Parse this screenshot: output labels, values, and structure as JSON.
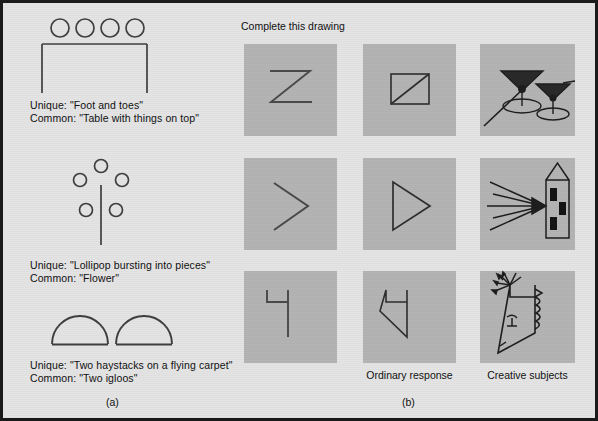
{
  "figure": {
    "background_color": "#e4e4e4",
    "border_color": "#1a1a1a",
    "cell_color": "#b4b4b4",
    "ink_color": "#3a3a3a"
  },
  "panel_a": {
    "letter": "(a)",
    "items": [
      {
        "name": "table-with-things-on-top",
        "unique": "Unique: \"Foot and toes\"",
        "common": "Common: \"Table with things on top\""
      },
      {
        "name": "flower",
        "unique": "Unique: \"Lollipop bursting into pieces\"",
        "common": "Common: \"Flower\""
      },
      {
        "name": "two-igloos",
        "unique": "Unique: \"Two haystacks on a flying carpet\"",
        "common": "Common: \"Two igloos\""
      }
    ]
  },
  "panel_b": {
    "letter": "(b)",
    "prompt": "Complete this drawing",
    "column_labels": [
      "",
      "Ordinary response",
      "Creative subjects"
    ],
    "rows": [
      {
        "stimulus": "zigzag-z-line",
        "ordinary": "square-with-diagonal",
        "creative": "two-martini-glasses"
      },
      {
        "stimulus": "chevron-arrowhead",
        "ordinary": "triangle",
        "creative": "rocket-with-speed-lines"
      },
      {
        "stimulus": "flag-hook-line",
        "ordinary": "arrow-pentagon",
        "creative": "face-profile-kite"
      }
    ]
  }
}
